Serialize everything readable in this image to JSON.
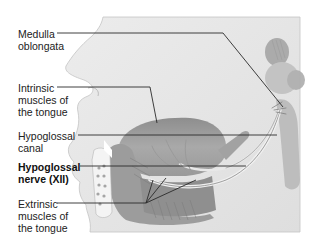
{
  "figure": {
    "colors": {
      "background": "#ffffff",
      "head_fill": "#e6e6e6",
      "tissue_dark": "#9a9a9a",
      "tissue_mid": "#b8b8b8",
      "leader_line": "#2a2a2a",
      "label_text": "#222222"
    }
  },
  "labels": [
    {
      "id": "medulla",
      "text": "Medulla\noblongata",
      "bold": false
    },
    {
      "id": "intrinsic",
      "text": "Intrinsic\nmuscles of\nthe tongue",
      "bold": false
    },
    {
      "id": "canal",
      "text": "Hypoglossal\ncanal",
      "bold": false
    },
    {
      "id": "nerve",
      "text": "Hypoglossal\nnerve (XII)",
      "bold": true
    },
    {
      "id": "extrinsic",
      "text": "Extrinsic\nmuscles of\nthe tongue",
      "bold": false
    }
  ]
}
